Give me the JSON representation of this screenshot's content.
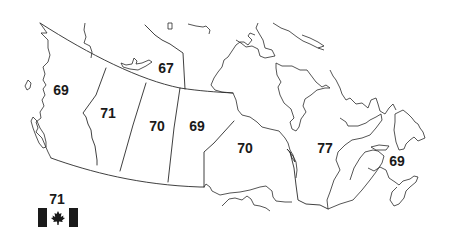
{
  "map": {
    "title": "",
    "country": "Canada",
    "colors": {
      "stroke": "#2a2a2a",
      "text": "#1a1a1a",
      "background": "#ffffff",
      "flag": "#1a1a1a"
    },
    "regions": [
      {
        "id": "bc",
        "name": "British Columbia",
        "value": "69",
        "x": 61,
        "y": 90
      },
      {
        "id": "nt",
        "name": "Northwest Territories",
        "value": "67",
        "x": 166,
        "y": 68
      },
      {
        "id": "ab",
        "name": "Alberta",
        "value": "71",
        "x": 108,
        "y": 113
      },
      {
        "id": "sk",
        "name": "Saskatchewan",
        "value": "70",
        "x": 157,
        "y": 126
      },
      {
        "id": "mb",
        "name": "Manitoba",
        "value": "69",
        "x": 197,
        "y": 126
      },
      {
        "id": "on",
        "name": "Ontario",
        "value": "70",
        "x": 245,
        "y": 148
      },
      {
        "id": "qc",
        "name": "Quebec",
        "value": "77",
        "x": 325,
        "y": 148
      },
      {
        "id": "atl",
        "name": "Atlantic Canada",
        "value": "69",
        "x": 397,
        "y": 161
      }
    ],
    "national": {
      "label": "Canada",
      "value": "71",
      "icon": "canada-flag-icon"
    }
  }
}
